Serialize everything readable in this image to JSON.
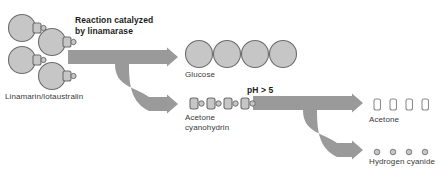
{
  "diagram": {
    "title_text": "Linamarin breakdown pathway",
    "colors": {
      "shape_fill": "#c6c6c6",
      "shape_stroke": "#6e6e6e",
      "arrow_fill": "#9a9a9a",
      "label_text": "#3a3a3a",
      "bold_text": "#1c1c1c",
      "background": "#ffffff",
      "open_fill": "#ffffff"
    },
    "labels": {
      "linamarin": "Linamarin/lotaustralin",
      "reaction_line1": "Reaction catalyzed",
      "reaction_line2": "by linamarase",
      "glucose": "Glucose",
      "acetone_cyanohydrin_line1": "Acetone",
      "acetone_cyanohydrin_line2": "cyanohydrin",
      "ph": "pH > 5",
      "acetone": "Acetone",
      "hydrogen_cyanide": "Hydrogen cyanide"
    },
    "molecules": {
      "linamarin_units": [
        {
          "cx": 22,
          "cy": 28
        },
        {
          "cx": 52,
          "cy": 42
        },
        {
          "cx": 22,
          "cy": 60
        },
        {
          "cx": 52,
          "cy": 76
        }
      ],
      "glucose_units": [
        {
          "cx": 199,
          "cy": 54
        },
        {
          "cx": 227,
          "cy": 54
        },
        {
          "cx": 255,
          "cy": 54
        },
        {
          "cx": 283,
          "cy": 54
        }
      ],
      "acetone_cyanohydrin_units": [
        {
          "x": 190,
          "y": 98
        },
        {
          "x": 207,
          "y": 98
        },
        {
          "x": 224,
          "y": 98
        },
        {
          "x": 241,
          "y": 98
        }
      ],
      "acetone_units": [
        {
          "x": 374,
          "y": 99
        },
        {
          "x": 390,
          "y": 99
        },
        {
          "x": 406,
          "y": 99
        },
        {
          "x": 422,
          "y": 99
        }
      ],
      "hydrogen_cyanide_units": [
        {
          "cx": 377,
          "cy": 152
        },
        {
          "cx": 393,
          "cy": 152
        },
        {
          "cx": 409,
          "cy": 152
        },
        {
          "cx": 425,
          "cy": 152
        }
      ]
    }
  }
}
